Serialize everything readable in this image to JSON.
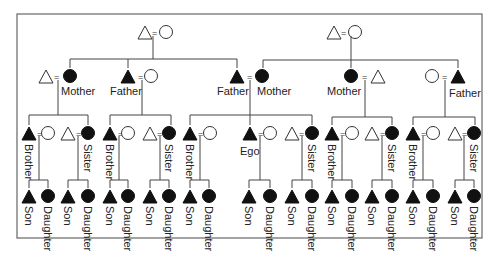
{
  "diagram": {
    "type": "kinship-chart",
    "colors": {
      "filled": "#111111",
      "outline": "#333333",
      "line": "#444444"
    },
    "symbols": {
      "male": "triangle",
      "female": "circle",
      "marriage": "="
    },
    "generation1": [
      {
        "couple": [
          "male-open",
          "female-open"
        ],
        "side": "paternal"
      },
      {
        "couple": [
          "male-open",
          "female-open"
        ],
        "side": "maternal"
      }
    ],
    "generation2": [
      {
        "spouse": "male-open",
        "person": "female-filled",
        "label": "Mother"
      },
      {
        "person": "male-filled",
        "spouse": "female-open",
        "label": "Father"
      },
      {
        "person": "male-filled",
        "label": "Father"
      },
      {
        "person": "female-filled",
        "label": "Mother"
      },
      {
        "person": "female-filled",
        "spouse": "male-open",
        "label": "Mother"
      },
      {
        "spouse": "female-open",
        "person": "male-filled",
        "label": "Father"
      }
    ],
    "generation3": [
      {
        "label": "Brother"
      },
      {
        "label": "Sister"
      },
      {
        "label": "Brother"
      },
      {
        "label": "Sister"
      },
      {
        "label": "Brother"
      },
      {
        "label": "Ego"
      },
      {
        "label": "Sister"
      },
      {
        "label": "Brother"
      },
      {
        "label": "Sister"
      },
      {
        "label": "Brother"
      },
      {
        "label": "Sister"
      }
    ],
    "generation4_labels": {
      "son": "Son",
      "daughter": "Daughter"
    },
    "equals": "="
  }
}
